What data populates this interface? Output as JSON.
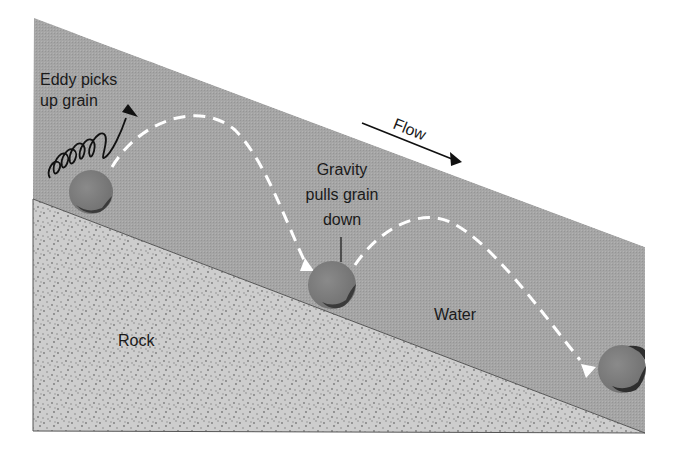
{
  "diagram": {
    "labels": {
      "eddy_line1": "Eddy picks",
      "eddy_line2": "up grain",
      "flow": "Flow",
      "gravity_line1": "Gravity",
      "gravity_line2": "pulls grain",
      "gravity_line3": "down",
      "water": "Water",
      "rock": "Rock"
    },
    "regions": [
      {
        "name": "water",
        "color": "#a3a3a3"
      },
      {
        "name": "rock",
        "color": "#c9c9c9"
      }
    ],
    "grains": [
      {
        "id": 1,
        "cx": 91,
        "cy": 192,
        "r": 22
      },
      {
        "id": 2,
        "cx": 332,
        "cy": 285,
        "r": 24
      },
      {
        "id": 3,
        "cx": 622,
        "cy": 369,
        "r": 24
      }
    ],
    "colors": {
      "water": "#a3a3a3",
      "rock": "#cacaca",
      "rock_dots": "#7a7a7a",
      "grain": "#7c7c7c",
      "grain_shadow": "#3a3a3a",
      "path": "#ffffff",
      "ink": "#1a1a1a"
    }
  }
}
